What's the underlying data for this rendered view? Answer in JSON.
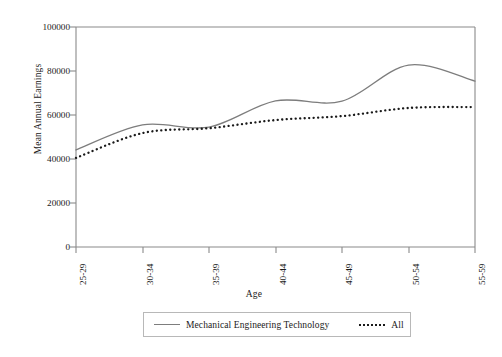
{
  "chart_data": {
    "type": "line",
    "title": "",
    "xlabel": "Age",
    "ylabel": "Mean Annual Earnings",
    "categories": [
      "25-29",
      "30-34",
      "35-39",
      "40-44",
      "45-49",
      "50-54",
      "55-59"
    ],
    "yticks": [
      "0",
      "20000",
      "40000",
      "60000",
      "80000",
      "100000"
    ],
    "ylim": [
      0,
      100000
    ],
    "grid": false,
    "legend_position": "bottom-center",
    "series": [
      {
        "name": "Mechanical Engineering Technology",
        "style": "solid",
        "color": "#7d7d7d",
        "values": [
          44100,
          55500,
          54500,
          66400,
          66300,
          82700,
          75400
        ]
      },
      {
        "name": "All",
        "style": "dotted",
        "color": "#1a1a1a",
        "values": [
          40500,
          51800,
          54000,
          57700,
          59500,
          63200,
          63600
        ]
      }
    ]
  },
  "legend": {
    "entries": [
      {
        "label": "Mechanical Engineering Technology"
      },
      {
        "label": "All"
      }
    ]
  },
  "colors": {
    "series_primary": "#7d7d7d",
    "series_secondary": "#1a1a1a",
    "axis": "#8a8a8a",
    "background": "#ffffff"
  }
}
